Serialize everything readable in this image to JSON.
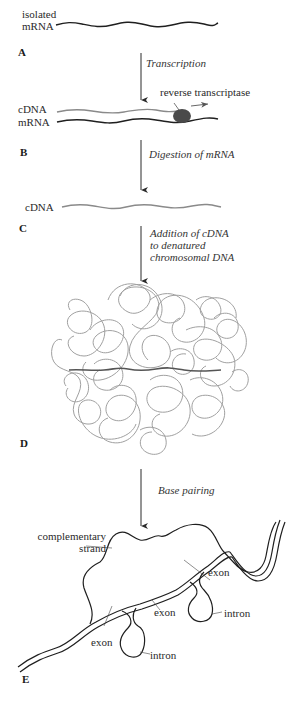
{
  "diagram": {
    "steps": [
      {
        "id": "A",
        "label": "A",
        "description": [
          "isolated",
          "mRNA"
        ]
      },
      {
        "id": "B",
        "label": "B",
        "strand_labels": [
          "cDNA",
          "mRNA"
        ],
        "enzyme": "reverse transcriptase"
      },
      {
        "id": "C",
        "label": "C",
        "strand_labels": [
          "cDNA"
        ]
      },
      {
        "id": "D",
        "label": "D"
      },
      {
        "id": "E",
        "label": "E"
      }
    ],
    "transitions": [
      {
        "from": "A",
        "to": "B",
        "lines": [
          "Transcription"
        ]
      },
      {
        "from": "B",
        "to": "C",
        "lines": [
          "Digestion of mRNA"
        ]
      },
      {
        "from": "C",
        "to": "D",
        "lines": [
          "Addition of cDNA",
          "to denatured",
          "chromosomal DNA"
        ]
      },
      {
        "from": "D",
        "to": "E",
        "lines": [
          "Base pairing"
        ]
      }
    ],
    "hybrid_labels": {
      "complementary_strand": [
        "complementary",
        "strand"
      ],
      "exon_1": "exon",
      "exon_2": "exon",
      "exon_3": "exon",
      "intron_1": "intron",
      "intron_2": "intron"
    },
    "colors": {
      "mrna": "#1f1f1f",
      "cdna": "#8a8a8a",
      "enzyme": "#4a4a4a",
      "chromosomal_dna": "#a0a0a0",
      "arrow": "#2a2a2a"
    }
  }
}
